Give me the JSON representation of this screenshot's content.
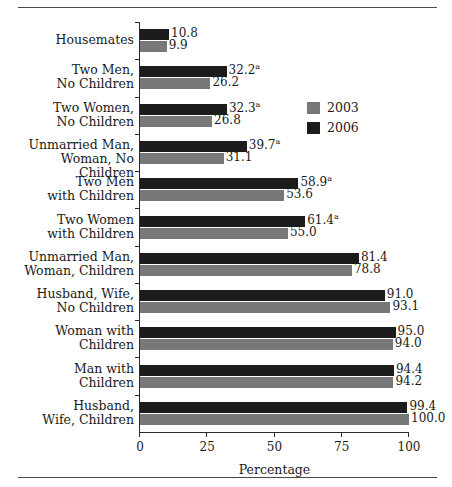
{
  "figure": {
    "top_rule": "horizontal-rule",
    "bottom_rule": "horizontal-rule"
  },
  "chart_data": {
    "type": "bar",
    "orientation": "horizontal",
    "title": "",
    "xlabel": "Percentage",
    "ylabel": "",
    "xlim": [
      0,
      100
    ],
    "xticks": [
      "0",
      "25",
      "50",
      "75",
      "100"
    ],
    "grid": false,
    "legend_position": "upper-right-inside",
    "categories": [
      "Housemates",
      "Two Men, No Children",
      "Two Women, No Children",
      "Unmarried Man, Woman, No Children",
      "Two Men with Children",
      "Two Women with Children",
      "Unmarried Man, Woman, Children",
      "Husband, Wife, No Children",
      "Woman with Children",
      "Man with Children",
      "Husband, Wife, Children"
    ],
    "category_lines": [
      [
        "Housemates"
      ],
      [
        "Two Men,",
        "No Children"
      ],
      [
        "Two Women,",
        "No Children"
      ],
      [
        "Unmarried Man,",
        "Woman, No Children"
      ],
      [
        "Two Men",
        "with Children"
      ],
      [
        "Two Women",
        "with Children"
      ],
      [
        "Unmarried Man,",
        "Woman, Children"
      ],
      [
        "Husband, Wife,",
        "No Children"
      ],
      [
        "Woman with",
        "Children"
      ],
      [
        "Man with",
        "Children"
      ],
      [
        "Husband,",
        "Wife, Children"
      ]
    ],
    "series": [
      {
        "name": "2003",
        "color": "#787878",
        "values": [
          9.9,
          26.2,
          26.8,
          31.1,
          53.6,
          55.0,
          78.8,
          93.1,
          94.0,
          94.2,
          100.0
        ],
        "labels": [
          "9.9",
          "26.2",
          "26.8",
          "31.1",
          "53.6",
          "55.0",
          "78.8",
          "93.1",
          "94.0",
          "94.2",
          "100.0"
        ],
        "footnote_marks": [
          "",
          "",
          "",
          "",
          "",
          "",
          "",
          "",
          "",
          "",
          ""
        ]
      },
      {
        "name": "2006",
        "color": "#1c1c1c",
        "values": [
          10.8,
          32.2,
          32.3,
          39.7,
          58.9,
          61.4,
          81.4,
          91.0,
          95.0,
          94.4,
          99.4
        ],
        "labels": [
          "10.8",
          "32.2",
          "32.3",
          "39.7",
          "58.9",
          "61.4",
          "81.4",
          "91.0",
          "95.0",
          "94.4",
          "99.4"
        ],
        "footnote_marks": [
          "",
          "a",
          "a",
          "a",
          "a",
          "a",
          "",
          "",
          "",
          "",
          ""
        ]
      }
    ]
  },
  "legend": {
    "entries": [
      {
        "label": "2003",
        "color": "#787878"
      },
      {
        "label": "2006",
        "color": "#1c1c1c"
      }
    ]
  }
}
